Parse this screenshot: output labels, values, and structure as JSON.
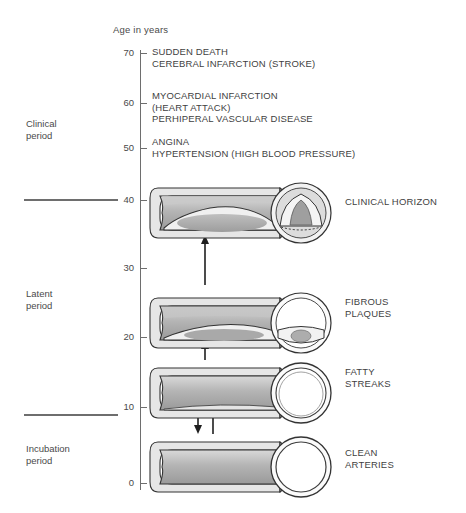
{
  "axis": {
    "title": "Age in years",
    "ticks": [
      {
        "value": "70",
        "y": 53
      },
      {
        "value": "60",
        "y": 103
      },
      {
        "value": "50",
        "y": 148
      },
      {
        "value": "40",
        "y": 200
      },
      {
        "value": "30",
        "y": 268
      },
      {
        "value": "20",
        "y": 337
      },
      {
        "value": "10",
        "y": 407
      },
      {
        "value": "0",
        "y": 483
      }
    ]
  },
  "periods": [
    {
      "name": "clinical-period",
      "line1": "Clinical",
      "line2": "period",
      "y": 118
    },
    {
      "name": "latent-period",
      "line1": "Latent",
      "line2": "period",
      "y": 288
    },
    {
      "name": "incubation-period",
      "line1": "Incubation",
      "line2": "period",
      "y": 443
    }
  ],
  "dividers": [
    {
      "name": "clinical-latent-divider",
      "y": 199
    },
    {
      "name": "latent-incubation-divider",
      "y": 414
    }
  ],
  "clinical_events": [
    {
      "name": "event-sudden-death",
      "y": 46,
      "lines": [
        "SUDDEN DEATH",
        "CEREBRAL INFARCTION (STROKE)"
      ]
    },
    {
      "name": "event-myocardial-infarction",
      "y": 90,
      "lines": [
        "MYOCARDIAL INFARCTION",
        "(HEART ATTACK)",
        "PERHIPERAL VASCULAR DISEASE"
      ]
    },
    {
      "name": "event-angina",
      "y": 136,
      "lines": [
        "ANGINA",
        "HYPERTENSION (HIGH BLOOD PRESSURE)"
      ]
    }
  ],
  "stages": [
    {
      "name": "stage-clinical-horizon",
      "label_y": 196,
      "row_y": 178,
      "lines": [
        "CLINICAL HORIZON"
      ]
    },
    {
      "name": "stage-fibrous-plaques",
      "label_y": 296,
      "row_y": 288,
      "lines": [
        "FIBROUS",
        "PLAQUES"
      ]
    },
    {
      "name": "stage-fatty-streaks",
      "label_y": 366,
      "row_y": 358,
      "lines": [
        "FATTY",
        "STREAKS"
      ]
    },
    {
      "name": "stage-clean-arteries",
      "label_y": 447,
      "row_y": 432,
      "lines": [
        "CLEAN",
        "ARTERIES"
      ]
    }
  ],
  "arrows": [
    {
      "name": "arrow-fibrous-to-clinical",
      "direction": "up",
      "top": 235,
      "height": 50,
      "x": 55
    },
    {
      "name": "arrow-fatty-to-fibrous",
      "direction": "up",
      "top": 340,
      "height": 20,
      "x": 55
    },
    {
      "name": "arrow-fatty-to-clean",
      "direction": "down",
      "top": 408,
      "height": 26,
      "x": 48
    },
    {
      "name": "arrow-clean-to-fatty",
      "direction": "up",
      "top": 408,
      "height": 26,
      "x": 63
    }
  ],
  "colors": {
    "ink": "#3a3a3a",
    "axis": "#6e6e6e",
    "wall_light": "#e8e8e8",
    "wall_mid": "#bdbdbd",
    "wall_dark": "#8f8f8f",
    "plaque": "#a8a8a8",
    "outline": "#2b2b2b"
  }
}
